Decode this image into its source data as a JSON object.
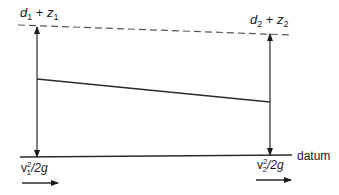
{
  "diagram": {
    "type": "energy-grade-line",
    "labels": {
      "top_left": {
        "base1": "d",
        "sub1": "1",
        "plus": " + ",
        "base2": "z",
        "sub2": "1"
      },
      "top_right": {
        "base1": "d",
        "sub1": "2",
        "plus": " + ",
        "base2": "z",
        "sub2": "2"
      },
      "datum": "datum",
      "bottom_left": {
        "base": "v",
        "sub": "1",
        "sup": "2",
        "rest": "/2g"
      },
      "bottom_right": {
        "base": "v",
        "sub": "2",
        "sup": "2",
        "rest": "/2g"
      }
    },
    "colors": {
      "line": "#2a2a2a",
      "dashed": "#555555",
      "background": "#ffffff"
    }
  }
}
